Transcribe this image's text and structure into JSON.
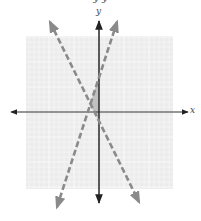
{
  "caption": {
    "text": "y          y"
  },
  "chart_data": {
    "type": "line",
    "title": "",
    "xlabel": "x",
    "ylabel": "y",
    "xlim": [
      -15,
      15
    ],
    "ylim": [
      -15,
      15
    ],
    "grid": true,
    "grid_step": 1,
    "grid_major_every": 5,
    "series": [
      {
        "name": "line-a",
        "equation": "y = -2x - 2",
        "slope": -2,
        "intercept": -2,
        "style": "dashed",
        "color": "#8a8a8a",
        "x": [
          -9.8,
          8
        ],
        "y": [
          18,
          -18
        ]
      },
      {
        "name": "line-b",
        "equation": "y = 3x + 7",
        "slope": 3,
        "intercept": 7,
        "style": "dashed",
        "color": "#8a8a8a",
        "x": [
          -8.4,
          3.6
        ],
        "y": [
          -19,
          18
        ]
      }
    ],
    "shaded_region": {
      "description": "region between the two dashed lines, left of the y-axis",
      "vertices": [
        [
          -1.8,
          1.6
        ],
        [
          0,
          7
        ],
        [
          0,
          -2
        ]
      ],
      "color": "#b8b8b8"
    },
    "legend": null
  },
  "layout": {
    "origin_px": [
      99,
      112
    ],
    "unit_px": 5,
    "grid_box_px": [
      26,
      36,
      173,
      189
    ],
    "grid_bg": "#ececec",
    "grid_line": "#f8f8f8",
    "axis_color": "#333333"
  },
  "labels": {
    "x_axis": "x",
    "y_axis": "y"
  }
}
